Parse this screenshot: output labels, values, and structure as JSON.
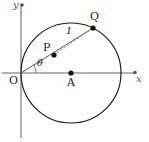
{
  "figure": {
    "background_color": "#ffffff",
    "width": 149,
    "height": 142
  },
  "axes": {
    "x_label": "x",
    "y_label": "y",
    "origin_label": "O",
    "axis_color": "#9a9a9a",
    "x_axis_y": 73,
    "y_axis_x": 21,
    "x_axis_from": 2,
    "x_axis_to": 136,
    "y_axis_from": 4,
    "y_axis_to": 138
  },
  "circle": {
    "center_x": 71,
    "center_y": 73,
    "radius": 50,
    "stroke_color": "#1a1a1a",
    "stroke_width": 1.1,
    "fill": "none"
  },
  "points": [
    {
      "name": "O",
      "label": "O",
      "x": 21,
      "y": 73,
      "label_x": 10,
      "label_y": 76,
      "dot": false
    },
    {
      "name": "A",
      "label": "A",
      "x": 71,
      "y": 73,
      "label_x": 67,
      "label_y": 78,
      "dot": true
    },
    {
      "name": "P",
      "label": "P",
      "x": 54,
      "y": 55,
      "label_x": 43,
      "label_y": 43,
      "dot": true
    },
    {
      "name": "Q",
      "label": "Q",
      "x": 93,
      "y": 28,
      "label_x": 91,
      "label_y": 12,
      "dot": true
    }
  ],
  "segments": [
    {
      "name": "ray-O-to-Q",
      "from": "O",
      "to": "Q",
      "style": "solid",
      "color": "#555555",
      "width": 1
    },
    {
      "name": "chord-P-to-Q",
      "from": "P",
      "to": "Q",
      "style": "dashed",
      "color": "#777777",
      "width": 0.9
    }
  ],
  "annotations": [
    {
      "name": "length-label",
      "text": "1",
      "x": 68,
      "y": 27
    },
    {
      "name": "angle-label",
      "text": "θ",
      "x": 39,
      "y": 59
    }
  ],
  "angle_arc": {
    "name": "theta-arc",
    "vertex_x": 21,
    "vertex_y": 73,
    "radius": 15,
    "color": "#555555"
  },
  "colors": {
    "stroke": "#1a1a1a",
    "axis": "#9a9a9a",
    "guide": "#777777",
    "text": "#1a1a1a"
  }
}
